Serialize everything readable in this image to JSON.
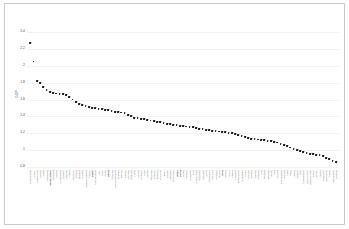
{
  "chart_data": {
    "type": "scatter",
    "title": "",
    "xlabel": "",
    "ylabel": "GDP",
    "ylim": [
      0.8,
      2.4
    ],
    "yticks": [
      2.4,
      2.2,
      2,
      1.8,
      1.6,
      1.4,
      1.2,
      1,
      0.8
    ],
    "ytick_labels": [
      "2.4",
      "2.2",
      "2",
      "1.8",
      "1.6",
      "1.4",
      "1.2",
      "1",
      "0.8"
    ],
    "grid": true,
    "legend": "none",
    "marker_color": "#1a1a1a",
    "gridline_color": "#f2f2f4",
    "categories": [
      "Luxembourg",
      "Norway",
      "Switzerland",
      "Ireland",
      "Qatar",
      "Singapore",
      "United States",
      "Denmark",
      "Iceland",
      "Netherlands",
      "Sweden",
      "Australia",
      "Austria",
      "Germany",
      "Finland",
      "Belgium",
      "Canada",
      "United Kingdom",
      "France",
      "Japan",
      "New Zealand",
      "Italy",
      "Israel",
      "Spain",
      "Korea",
      "Slovenia",
      "Czech Republic",
      "Portugal",
      "Estonia",
      "Greece",
      "Slovakia",
      "Lithuania",
      "Latvia",
      "Poland",
      "Hungary",
      "Chile",
      "Croatia",
      "Romania",
      "Uruguay",
      "Bulgaria",
      "Malaysia",
      "Turkey",
      "Mexico",
      "Argentina",
      "Costa Rica",
      "Brazil",
      "China",
      "Serbia",
      "Thailand",
      "Colombia",
      "Peru",
      "South Africa",
      "Indonesia",
      "Ecuador",
      "Egypt",
      "Philippines",
      "Viet Nam",
      "Morocco",
      "Bolivia",
      "India",
      "Ghana",
      "Kenya",
      "Nigeria",
      "Pakistan",
      "Bangladesh",
      "Cambodia",
      "Nepal",
      "Tanzania",
      "Uganda",
      "Zambia",
      "Senegal",
      "Mali",
      "Rwanda",
      "Ethiopia",
      "Benin",
      "Haiti",
      "Malawi",
      "Mozambique",
      "Burundi",
      "Niger",
      "Chad",
      "Liberia",
      "Guinea",
      "Togo",
      "Madagascar",
      "Sierra Leone",
      "Burkina Faso",
      "Sudan",
      "Yemen",
      "Angola",
      "Cameroon",
      "Zimbabwe",
      "Congo",
      "Afghanistan",
      "Somalia"
    ],
    "emphasized_categories": [
      "United States",
      "Japan",
      "Korea",
      "China",
      "India",
      "Brazil"
    ],
    "values": [
      2.27,
      2.05,
      1.82,
      1.79,
      1.75,
      1.71,
      1.69,
      1.68,
      1.67,
      1.665,
      1.66,
      1.655,
      1.63,
      1.6,
      1.575,
      1.55,
      1.535,
      1.52,
      1.51,
      1.5,
      1.495,
      1.49,
      1.485,
      1.48,
      1.47,
      1.465,
      1.455,
      1.45,
      1.445,
      1.44,
      1.42,
      1.4,
      1.385,
      1.375,
      1.37,
      1.365,
      1.355,
      1.35,
      1.345,
      1.335,
      1.33,
      1.325,
      1.31,
      1.305,
      1.3,
      1.295,
      1.29,
      1.285,
      1.28,
      1.275,
      1.27,
      1.265,
      1.25,
      1.245,
      1.24,
      1.235,
      1.23,
      1.225,
      1.22,
      1.215,
      1.21,
      1.205,
      1.2,
      1.19,
      1.18,
      1.165,
      1.15,
      1.14,
      1.135,
      1.13,
      1.125,
      1.12,
      1.115,
      1.11,
      1.105,
      1.1,
      1.09,
      1.075,
      1.06,
      1.045,
      1.03,
      1.015,
      1.0,
      0.985,
      0.975,
      0.965,
      0.955,
      0.95,
      0.945,
      0.94,
      0.925,
      0.91,
      0.895,
      0.875,
      0.855
    ]
  }
}
